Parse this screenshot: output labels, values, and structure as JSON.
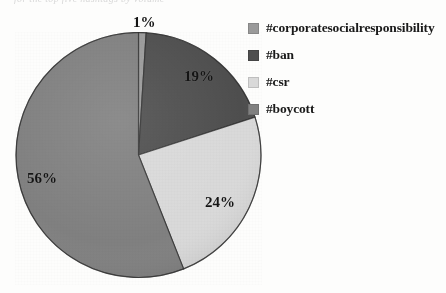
{
  "figure": {
    "clipped_header_text": "for the top five hashtags by volume"
  },
  "chart_data": {
    "type": "pie",
    "title": "",
    "subtitle": "",
    "xlabel": "",
    "ylabel": "",
    "grid": false,
    "legend_position": "right",
    "start_angle_deg": 0,
    "direction": "clockwise",
    "categories": [
      "#corporatesocialresponsibility",
      "#ban",
      "#csr",
      "#boycott"
    ],
    "values": [
      1,
      19,
      24,
      56
    ],
    "value_labels": [
      "1%",
      "19%",
      "24%",
      "56%"
    ],
    "colors": [
      "#9a9a9a",
      "#4e4e4e",
      "#d9d9d9",
      "#808080"
    ],
    "slices": [
      {
        "label": "#corporatesocialresponsibility",
        "value": 1,
        "value_label": "1%",
        "color": "#9a9a9a",
        "start_deg": 0,
        "end_deg": 3.6
      },
      {
        "label": "#ban",
        "value": 19,
        "value_label": "19%",
        "color": "#4e4e4e",
        "start_deg": 3.6,
        "end_deg": 72
      },
      {
        "label": "#csr",
        "value": 24,
        "value_label": "24%",
        "color": "#d9d9d9",
        "start_deg": 72,
        "end_deg": 158.4
      },
      {
        "label": "#boycott",
        "value": 56,
        "value_label": "56%",
        "color": "#808080",
        "start_deg": 158.4,
        "end_deg": 360
      }
    ]
  },
  "legend": {
    "items": [
      {
        "label": "#corporatesocialresponsibility",
        "color": "#9a9a9a",
        "swatch_name": "legend-swatch-corporatesocialresponsibility"
      },
      {
        "label": "#ban",
        "color": "#4e4e4e",
        "swatch_name": "legend-swatch-ban"
      },
      {
        "label": "#csr",
        "color": "#d9d9d9",
        "swatch_name": "legend-swatch-csr"
      },
      {
        "label": "#boycott",
        "color": "#808080",
        "swatch_name": "legend-swatch-boycott"
      }
    ]
  }
}
